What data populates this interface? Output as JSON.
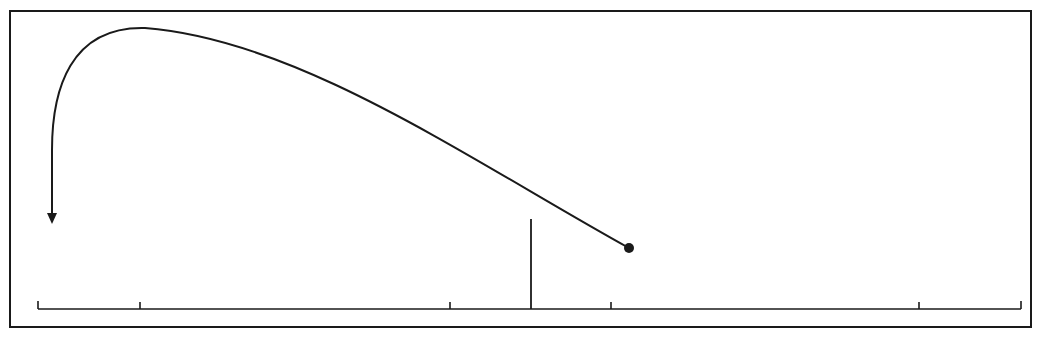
{
  "diagram": {
    "colors": {
      "background": "#ffffff",
      "ink": "#1a1a1a"
    },
    "frame": {
      "x": 10,
      "y": 11,
      "width": 1021,
      "height": 316
    },
    "scale": {
      "baseline_y": 309,
      "x_start": 38,
      "x_end": 1021,
      "end_tick_top_y": 302,
      "tick_top_y": 302,
      "ticks_x": [
        38,
        140,
        450,
        611,
        919,
        1021
      ]
    },
    "marker": {
      "x": 531,
      "y_top": 219,
      "y_bottom": 309,
      "label": ""
    },
    "trajectory": {
      "start_point": {
        "x": 629,
        "y": 248,
        "radius": 5
      },
      "apex": {
        "x": 145,
        "y": 28
      },
      "end_arrow_tip": {
        "x": 52,
        "y": 223
      },
      "path": "M 629 248 C 470 160, 300 40, 145 28 C 70 26, 52 90, 52 150 L 52 213"
    },
    "labels": []
  }
}
